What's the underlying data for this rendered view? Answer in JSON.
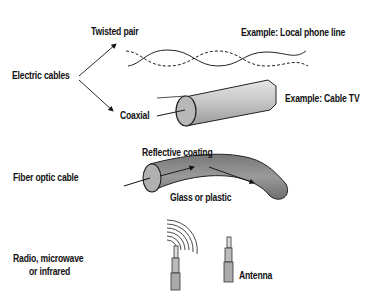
{
  "categories": {
    "electric": "Electric cables",
    "fiber": "Fiber optic cable",
    "radio_line1": "Radio, microwave",
    "radio_line2": "or infrared"
  },
  "electric": {
    "twisted_pair": "Twisted pair",
    "twisted_example": "Example: Local phone line",
    "coaxial": "Coaxial",
    "coaxial_example": "Example: Cable TV"
  },
  "fiber": {
    "coating": "Reflective coating",
    "core": "Glass or plastic"
  },
  "radio": {
    "antenna": "Antenna"
  },
  "colors": {
    "ink": "#111111",
    "cable_fill": "#b5b5b5",
    "fiber_fill": "#8e8e8e"
  }
}
